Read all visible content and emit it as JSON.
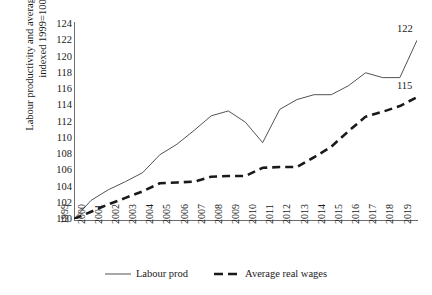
{
  "chart_data": {
    "type": "line",
    "title": "",
    "xlabel": "",
    "ylabel": "Labour productivity and average real wages indexed 1999=100",
    "ylim": [
      100,
      124
    ],
    "yticks": [
      100,
      102,
      104,
      106,
      108,
      110,
      112,
      114,
      116,
      118,
      120,
      122,
      124
    ],
    "grid": false,
    "legend_position": "bottom-center",
    "categories": [
      "1999",
      "2000",
      "2001",
      "2002",
      "2003",
      "2004",
      "2005",
      "2006",
      "2007",
      "2008",
      "2009",
      "2010",
      "2011",
      "2012",
      "2013",
      "2014",
      "2015",
      "2016",
      "2017",
      "2018",
      "2019"
    ],
    "series": [
      {
        "name": "Labour prod",
        "style": "solid-thin",
        "color": "#3f3f3f",
        "values": [
          100.0,
          102.3,
          103.6,
          104.6,
          105.7,
          107.9,
          109.2,
          110.9,
          112.7,
          113.3,
          111.9,
          109.4,
          113.5,
          114.7,
          115.3,
          115.3,
          116.4,
          118.0,
          117.4,
          117.4,
          122.0
        ],
        "end_label": "122"
      },
      {
        "name": "Average real wages",
        "style": "dashed-thick",
        "color": "#1a1a1a",
        "values": [
          100.0,
          100.9,
          101.8,
          102.6,
          103.4,
          104.4,
          104.5,
          104.6,
          105.2,
          105.3,
          105.3,
          106.3,
          106.4,
          106.4,
          107.6,
          108.9,
          110.8,
          112.6,
          113.2,
          113.9,
          115.0
        ],
        "end_label": "115"
      }
    ]
  },
  "legend": {
    "items": [
      {
        "label": "Labour prod",
        "style": "solid-thin"
      },
      {
        "label": "Average real wages",
        "style": "dashed-thick"
      }
    ]
  }
}
